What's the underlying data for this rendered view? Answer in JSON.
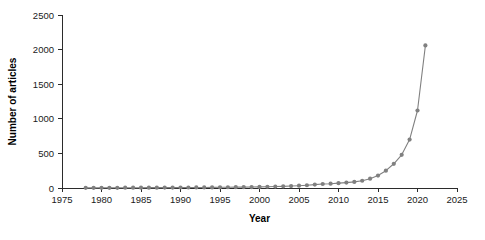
{
  "chart_data": {
    "type": "line",
    "title": "",
    "xlabel": "Year",
    "ylabel": "Number of articles",
    "xlim": [
      1975,
      2025
    ],
    "ylim": [
      0,
      2500
    ],
    "xticks": [
      1975,
      1980,
      1985,
      1990,
      1995,
      2000,
      2005,
      2010,
      2015,
      2020,
      2025
    ],
    "yticks": [
      0,
      500,
      1000,
      1500,
      2000,
      2500
    ],
    "xtick_labels": [
      "1975",
      "1980",
      "1985",
      "1990",
      "1995",
      "2000",
      "2005",
      "2010",
      "2015",
      "2020",
      "2025"
    ],
    "ytick_labels": [
      "0",
      "500",
      "1000",
      "1500",
      "2000",
      "2500"
    ],
    "grid": false,
    "legend": false,
    "legend_position": "none",
    "marker": "circle",
    "series_color": "#808080",
    "series": [
      {
        "name": "Number of articles",
        "x": [
          1978,
          1979,
          1980,
          1981,
          1982,
          1983,
          1984,
          1985,
          1986,
          1987,
          1988,
          1989,
          1990,
          1991,
          1992,
          1993,
          1994,
          1995,
          1996,
          1997,
          1998,
          1999,
          2000,
          2001,
          2002,
          2003,
          2004,
          2005,
          2006,
          2007,
          2008,
          2009,
          2010,
          2011,
          2012,
          2013,
          2014,
          2015,
          2016,
          2017,
          2018,
          2019,
          2020,
          2021
        ],
        "values": [
          2,
          2,
          3,
          3,
          3,
          4,
          4,
          4,
          5,
          5,
          6,
          6,
          7,
          7,
          8,
          8,
          9,
          10,
          11,
          12,
          13,
          14,
          16,
          18,
          21,
          24,
          28,
          33,
          40,
          49,
          58,
          62,
          70,
          78,
          88,
          105,
          135,
          180,
          250,
          350,
          480,
          700,
          1120,
          2060
        ]
      }
    ]
  },
  "axis": {
    "x_title": "Year",
    "y_title": "Number of articles"
  }
}
